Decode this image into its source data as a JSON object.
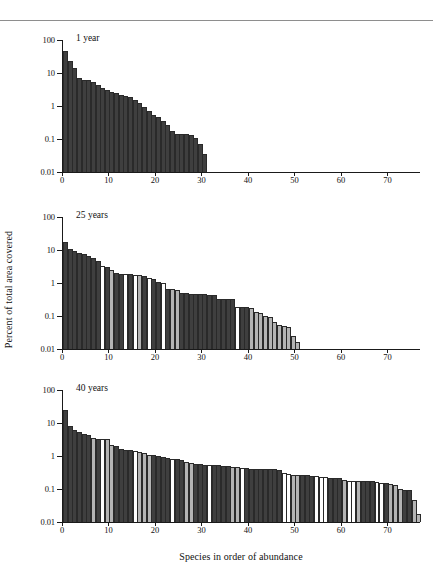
{
  "figure": {
    "ylabel": "Percent of total area covered",
    "xlabel": "Species in order of abundance"
  },
  "chart_data": [
    {
      "type": "bar",
      "title": "1 year",
      "xlabel": "Species in order of abundance",
      "ylabel": "Percent of total area covered",
      "yscale": "log",
      "ylim": [
        0.01,
        100
      ],
      "yticks": [
        0.01,
        0.1,
        1,
        10,
        100
      ],
      "ytick_labels": [
        "0.01",
        "0.1",
        "1",
        "10",
        "100"
      ],
      "xlim": [
        0,
        77
      ],
      "xticks": [
        0,
        10,
        20,
        30,
        40,
        50,
        60,
        70
      ],
      "xtick_labels": [
        "0",
        "10",
        "20",
        "30",
        "40",
        "50",
        "60",
        "70"
      ],
      "grid": false,
      "legend": "none",
      "n_species": 31,
      "categories": [
        1,
        2,
        3,
        4,
        5,
        6,
        7,
        8,
        9,
        10,
        11,
        12,
        13,
        14,
        15,
        16,
        17,
        18,
        19,
        20,
        21,
        22,
        23,
        24,
        25,
        26,
        27,
        28,
        29,
        30,
        31
      ],
      "values": [
        45,
        23,
        14,
        7.2,
        6.3,
        6.0,
        5.2,
        4.3,
        3.6,
        3.1,
        2.7,
        2.4,
        2.2,
        2.0,
        1.85,
        1.5,
        1.2,
        0.95,
        0.72,
        0.55,
        0.45,
        0.36,
        0.26,
        0.175,
        0.145,
        0.14,
        0.14,
        0.135,
        0.105,
        0.07,
        0.036
      ],
      "fills": [
        "dark",
        "dark",
        "dark",
        "dark",
        "dark",
        "dark",
        "dark",
        "dark",
        "dark",
        "dark",
        "dark",
        "dark",
        "dark",
        "dark",
        "dark",
        "dark",
        "dark",
        "dark",
        "dark",
        "dark",
        "dark",
        "dark",
        "dark",
        "dark",
        "dark",
        "dark",
        "dark",
        "dark",
        "dark",
        "dark",
        "dark"
      ]
    },
    {
      "type": "bar",
      "title": "25 years",
      "xlabel": "Species in order of abundance",
      "ylabel": "Percent of total area covered",
      "yscale": "log",
      "ylim": [
        0.01,
        100
      ],
      "yticks": [
        0.01,
        0.1,
        1,
        10,
        100
      ],
      "ytick_labels": [
        "0.01",
        "0.1",
        "1",
        "10",
        "100"
      ],
      "xlim": [
        0,
        77
      ],
      "xticks": [
        0,
        10,
        20,
        30,
        40,
        50,
        60,
        70
      ],
      "xtick_labels": [
        "0",
        "10",
        "20",
        "30",
        "40",
        "50",
        "60",
        "70"
      ],
      "grid": false,
      "legend": "none",
      "n_species": 51,
      "categories": [
        1,
        2,
        3,
        4,
        5,
        6,
        7,
        8,
        9,
        10,
        11,
        12,
        13,
        14,
        15,
        16,
        17,
        18,
        19,
        20,
        21,
        22,
        23,
        24,
        25,
        26,
        27,
        28,
        29,
        30,
        31,
        32,
        33,
        34,
        35,
        36,
        37,
        38,
        39,
        40,
        41,
        42,
        43,
        44,
        45,
        46,
        47,
        48,
        49,
        50,
        51
      ],
      "values": [
        18,
        11,
        9.5,
        8.2,
        7.4,
        6.6,
        5.6,
        4.6,
        3.2,
        3.1,
        2.4,
        2.0,
        1.9,
        1.9,
        1.85,
        1.8,
        1.75,
        1.6,
        1.45,
        1.3,
        1.05,
        0.98,
        0.66,
        0.64,
        0.62,
        0.5,
        0.5,
        0.48,
        0.47,
        0.46,
        0.45,
        0.44,
        0.42,
        0.33,
        0.33,
        0.33,
        0.32,
        0.19,
        0.19,
        0.185,
        0.18,
        0.13,
        0.125,
        0.1,
        0.095,
        0.065,
        0.055,
        0.05,
        0.045,
        0.024,
        0.016
      ],
      "fills": [
        "dark",
        "dark",
        "dark",
        "dark",
        "dark",
        "dark",
        "dark",
        "dark",
        "white",
        "dark",
        "light",
        "dark",
        "dark",
        "white",
        "dark",
        "white",
        "light",
        "dark",
        "white",
        "dark",
        "dark",
        "white",
        "dark",
        "light",
        "light",
        "dark",
        "dark",
        "dark",
        "dark",
        "dark",
        "dark",
        "dark",
        "dark",
        "dark",
        "dark",
        "dark",
        "dark",
        "white",
        "dark",
        "dark",
        "light",
        "light",
        "light",
        "light",
        "light",
        "light",
        "light",
        "light",
        "light",
        "light",
        "light"
      ]
    },
    {
      "type": "bar",
      "title": "40 years",
      "xlabel": "Species in order of abundance",
      "ylabel": "Percent of total area covered",
      "yscale": "log",
      "ylim": [
        0.01,
        100
      ],
      "yticks": [
        0.01,
        0.1,
        1,
        10,
        100
      ],
      "ytick_labels": [
        "0.01",
        "0.1",
        "1",
        "10",
        "100"
      ],
      "xlim": [
        0,
        77
      ],
      "xticks": [
        0,
        10,
        20,
        30,
        40,
        50,
        60,
        70
      ],
      "xtick_labels": [
        "0",
        "10",
        "20",
        "30",
        "40",
        "50",
        "60",
        "70"
      ],
      "grid": false,
      "legend": "none",
      "n_species": 77,
      "categories": [
        1,
        2,
        3,
        4,
        5,
        6,
        7,
        8,
        9,
        10,
        11,
        12,
        13,
        14,
        15,
        16,
        17,
        18,
        19,
        20,
        21,
        22,
        23,
        24,
        25,
        26,
        27,
        28,
        29,
        30,
        31,
        32,
        33,
        34,
        35,
        36,
        37,
        38,
        39,
        40,
        41,
        42,
        43,
        44,
        45,
        46,
        47,
        48,
        49,
        50,
        51,
        52,
        53,
        54,
        55,
        56,
        57,
        58,
        59,
        60,
        61,
        62,
        63,
        64,
        65,
        66,
        67,
        68,
        69,
        70,
        71,
        72,
        73,
        74,
        75,
        76,
        77
      ],
      "values": [
        25,
        8.2,
        6.0,
        5.2,
        4.8,
        4.2,
        3.6,
        3.3,
        3.3,
        3.3,
        2.2,
        2.0,
        1.6,
        1.55,
        1.55,
        1.4,
        1.35,
        1.2,
        1.1,
        1.05,
        1.0,
        0.95,
        0.85,
        0.8,
        0.8,
        0.75,
        0.66,
        0.6,
        0.58,
        0.56,
        0.53,
        0.52,
        0.52,
        0.52,
        0.5,
        0.5,
        0.48,
        0.45,
        0.42,
        0.42,
        0.4,
        0.4,
        0.4,
        0.4,
        0.4,
        0.4,
        0.38,
        0.3,
        0.28,
        0.27,
        0.27,
        0.27,
        0.26,
        0.24,
        0.24,
        0.23,
        0.23,
        0.22,
        0.22,
        0.21,
        0.19,
        0.18,
        0.18,
        0.18,
        0.175,
        0.17,
        0.17,
        0.16,
        0.155,
        0.15,
        0.145,
        0.13,
        0.1,
        0.095,
        0.095,
        0.045,
        0.018
      ],
      "fills": [
        "dark",
        "dark",
        "dark",
        "dark",
        "dark",
        "dark",
        "light",
        "dark",
        "white",
        "light",
        "light",
        "dark",
        "dark",
        "dark",
        "dark",
        "white",
        "light",
        "light",
        "light",
        "dark",
        "dark",
        "dark",
        "dark",
        "white",
        "dark",
        "dark",
        "light",
        "light",
        "dark",
        "dark",
        "dark",
        "white",
        "dark",
        "dark",
        "dark",
        "dark",
        "light",
        "light",
        "white",
        "dark",
        "dark",
        "dark",
        "dark",
        "dark",
        "dark",
        "dark",
        "dark",
        "white",
        "white",
        "light",
        "light",
        "dark",
        "dark",
        "dark",
        "white",
        "white",
        "white",
        "dark",
        "dark",
        "dark",
        "light",
        "white",
        "white",
        "light",
        "dark",
        "dark",
        "dark",
        "white",
        "white",
        "dark",
        "light",
        "light",
        "light",
        "dark",
        "dark",
        "light",
        "light"
      ]
    }
  ]
}
